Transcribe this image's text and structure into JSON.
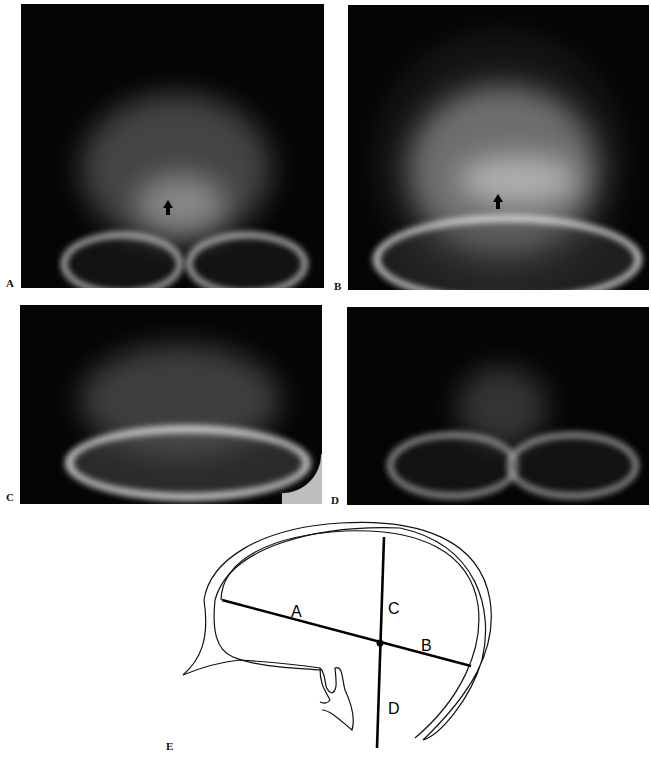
{
  "figure": {
    "panels": [
      {
        "id": "A",
        "label": "A",
        "type": "radiograph",
        "view": "frontal skull",
        "has_arrow": true,
        "arrow_direction": "up"
      },
      {
        "id": "B",
        "label": "B",
        "type": "radiograph",
        "view": "frontal skull",
        "has_arrow": true,
        "arrow_direction": "up"
      },
      {
        "id": "C",
        "label": "C",
        "type": "radiograph",
        "view": "frontal skull",
        "has_arrow": false
      },
      {
        "id": "D",
        "label": "D",
        "type": "radiograph",
        "view": "frontal skull",
        "has_arrow": false
      }
    ],
    "diagram": {
      "label": "E",
      "type": "line drawing",
      "subject": "lateral skull outline with projection axes",
      "line_labels": {
        "a": "A",
        "b": "B",
        "c": "C",
        "d": "D"
      }
    }
  }
}
